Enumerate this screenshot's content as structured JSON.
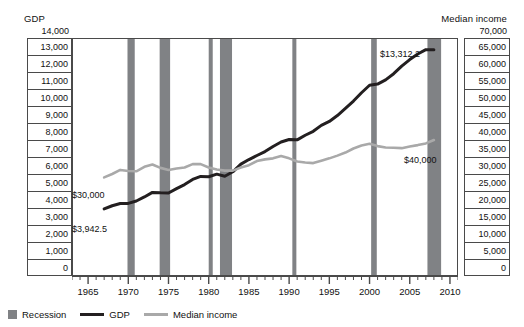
{
  "chart_data": {
    "type": "line",
    "title": "",
    "xlabel": "",
    "ylabel": "GDP",
    "y2label": "Median income",
    "grid": true,
    "legend_position": "bottom-left",
    "x": [
      1967,
      1968,
      1969,
      1970,
      1971,
      1972,
      1973,
      1974,
      1975,
      1976,
      1977,
      1978,
      1979,
      1980,
      1981,
      1982,
      1983,
      1984,
      1985,
      1986,
      1987,
      1988,
      1989,
      1990,
      1991,
      1992,
      1993,
      1994,
      1995,
      1996,
      1997,
      1998,
      1999,
      2000,
      2001,
      2002,
      2003,
      2004,
      2005,
      2006,
      2007,
      2008
    ],
    "xlim": [
      1963,
      2011
    ],
    "xticks": [
      1965,
      1970,
      1975,
      1980,
      1985,
      1990,
      1995,
      2000,
      2005,
      2010
    ],
    "xtick_labels": [
      "1965",
      "1970",
      "1975",
      "1980",
      "1985",
      "1990",
      "1995",
      "2000",
      "2005",
      "2010"
    ],
    "ylim": [
      0,
      14000
    ],
    "yticks": [
      0,
      1000,
      2000,
      3000,
      4000,
      5000,
      6000,
      7000,
      8000,
      9000,
      10000,
      11000,
      12000,
      13000,
      14000
    ],
    "ytick_labels": [
      "0",
      "1,000",
      "2,000",
      "3,000",
      "4,000",
      "5,000",
      "6,000",
      "7,000",
      "8,000",
      "9,000",
      "10,000",
      "11,000",
      "12,000",
      "13,000",
      "14,000"
    ],
    "y2lim": [
      0,
      70000
    ],
    "y2ticks": [
      0,
      5000,
      10000,
      15000,
      20000,
      25000,
      30000,
      35000,
      40000,
      45000,
      50000,
      55000,
      60000,
      65000,
      70000
    ],
    "y2tick_labels": [
      "0",
      "5,000",
      "10,000",
      "15,000",
      "20,000",
      "25,000",
      "30,000",
      "35,000",
      "40,000",
      "45,000",
      "50,000",
      "55,000",
      "60,000",
      "65,000",
      "70,000"
    ],
    "series": [
      {
        "name": "GDP",
        "color": "#231f20",
        "axis": "left",
        "values": [
          3942.5,
          4133,
          4262,
          4270,
          4410,
          4650,
          4917,
          4890,
          4880,
          5140,
          5380,
          5680,
          5860,
          5840,
          5990,
          5870,
          6130,
          6580,
          6850,
          7090,
          7320,
          7620,
          7880,
          8030,
          8010,
          8280,
          8510,
          8860,
          9090,
          9440,
          9860,
          10290,
          10780,
          11220,
          11290,
          11540,
          11900,
          12350,
          12730,
          13060,
          13312.2,
          13312.2
        ],
        "start_label": "$3,942.5",
        "end_label": "$13,312.2"
      },
      {
        "name": "Median income",
        "color": "#a9a9a9",
        "axis": "right",
        "values": [
          29000,
          30000,
          31200,
          30900,
          30800,
          32100,
          32800,
          31800,
          31200,
          31600,
          31900,
          32900,
          32900,
          31900,
          31300,
          31000,
          31000,
          31900,
          32600,
          33800,
          34300,
          34600,
          35300,
          34600,
          33700,
          33400,
          33200,
          33900,
          34600,
          35400,
          36300,
          37500,
          38400,
          38900,
          38200,
          37800,
          37700,
          37600,
          38100,
          38500,
          39000,
          40000
        ],
        "start_label": "$30,000",
        "end_label": "$40,000"
      }
    ],
    "recessions": [
      {
        "label": "1969-1970",
        "start": 1969.9,
        "end": 1970.8
      },
      {
        "label": "1973-1975",
        "start": 1973.9,
        "end": 1975.2
      },
      {
        "label": "1980",
        "start": 1980.0,
        "end": 1980.5
      },
      {
        "label": "1981-1982",
        "start": 1981.4,
        "end": 1982.9
      },
      {
        "label": "1990-1991",
        "start": 1990.4,
        "end": 1990.9
      },
      {
        "label": "2001",
        "start": 2000.2,
        "end": 2000.9
      },
      {
        "label": "2007-2009",
        "start": 2007.2,
        "end": 2008.9
      }
    ],
    "recession_color": "#808285",
    "recession_legend_label": "Recession"
  },
  "axes": {
    "left_title": "GDP",
    "right_title": "Median income"
  },
  "legend": {
    "items": [
      {
        "label": "Recession",
        "kind": "box",
        "color": "#808285"
      },
      {
        "label": "GDP",
        "kind": "line",
        "color": "#231f20"
      },
      {
        "label": "Median income",
        "kind": "line",
        "color": "#a9a9a9"
      }
    ]
  },
  "callouts": {
    "gdp_start": "$3,942.5",
    "gdp_end": "$13,312.2",
    "income_start": "$30,000",
    "income_end": "$40,000"
  }
}
